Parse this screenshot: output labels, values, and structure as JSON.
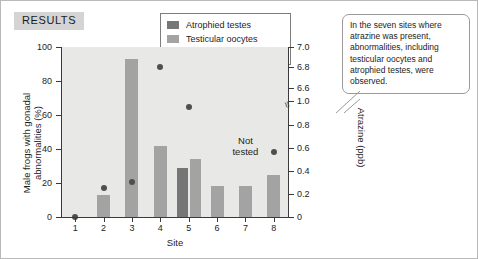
{
  "badge": {
    "label": "RESULTS"
  },
  "callout": {
    "text": "In the seven sites where atrazine was present, abnormalities, including testicular oocytes and atrophied testes, were observed."
  },
  "annotations": {
    "not_tested": "Not\ntested",
    "not_tested_line1": "Not",
    "not_tested_line2": "tested"
  },
  "colors": {
    "atrophied_testes": "#767676",
    "testicular_oocytes": "#a3a3a3",
    "atrazine_dot": "#4f4f4f",
    "plot_background": "#e8e8e6",
    "badge_background": "#d4d4d4",
    "axis": "#3a3a3a"
  },
  "chart_data": {
    "type": "bar",
    "title": "RESULTS",
    "xlabel": "Site",
    "ylabel": "Male frogs with gonadal abnormalities (%)",
    "y2label": "Atrazine (ppb)",
    "categories": [
      "1",
      "2",
      "3",
      "4",
      "5",
      "6",
      "7",
      "8"
    ],
    "ylim": [
      0,
      100
    ],
    "yticks": [
      0,
      20,
      40,
      60,
      80,
      100
    ],
    "y2lim": [
      0,
      7.0
    ],
    "y2ticks": [
      "0",
      "0.2",
      "0.4",
      "0.6",
      "0.8",
      "1.0",
      "6.6",
      "6.8",
      "7.0"
    ],
    "y2_axis_break": true,
    "grid": false,
    "legend_position": "top-center",
    "series": [
      {
        "name": "Atrophied testes",
        "type": "bar",
        "color": "#767676",
        "values": [
          0,
          0,
          0,
          0,
          29,
          0,
          0,
          0
        ]
      },
      {
        "name": "Testicular oocytes",
        "type": "bar",
        "color": "#a3a3a3",
        "values": [
          0,
          13,
          93,
          42,
          34,
          18,
          18,
          25
        ]
      },
      {
        "name": "Atrazine level",
        "type": "scatter",
        "axis": "right",
        "color": "#4f4f4f",
        "values": [
          0,
          0.25,
          0.3,
          6.8,
          0.95,
          null,
          null,
          0.56
        ]
      }
    ],
    "annotations": [
      {
        "text": "Not tested",
        "site": "7"
      }
    ]
  },
  "legend": {
    "items": [
      {
        "label": "Atrophied testes",
        "marker": "square",
        "color": "#767676"
      },
      {
        "label": "Testicular oocytes",
        "marker": "square",
        "color": "#a3a3a3"
      },
      {
        "label": "Atrazine level",
        "marker": "dot",
        "color": "#4f4f4f"
      }
    ]
  }
}
